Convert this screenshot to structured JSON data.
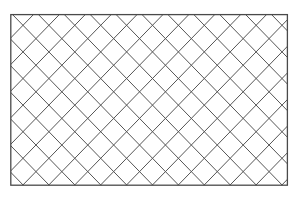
{
  "canvas": {
    "width": 298,
    "height": 201,
    "background": "#ffffff"
  },
  "frame": {
    "x": 10.8,
    "y": 14.6,
    "width": 276.6,
    "height": 170.6,
    "stroke": "#4a4a4a",
    "stroke_width": 1.3
  },
  "lattice": {
    "type": "diagonal-crosshatch",
    "origin_crossing": {
      "x": 23.0,
      "y": 25.3
    },
    "half_step_x": 12.95,
    "half_step_y": 13.3,
    "stroke": "#555555",
    "stroke_width": 1.0
  }
}
